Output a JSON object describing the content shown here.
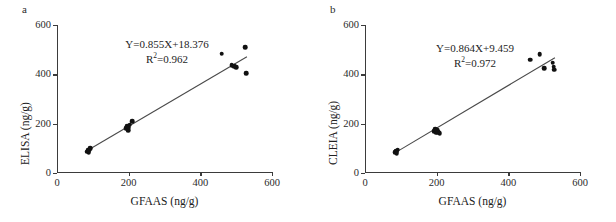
{
  "figure": {
    "background": "#ffffff",
    "marker_color": "#111111",
    "line_color": "#4a4a4a",
    "axis_color": "#3b3b3b"
  },
  "panels": [
    {
      "label": "a",
      "equation": "Y=0.855X+18.376",
      "r2_prefix": "R",
      "r2_exponent": "2",
      "r2_value": "=0.962"
    },
    {
      "label": "b",
      "equation": "Y=0.864X+9.459",
      "r2_prefix": "R",
      "r2_exponent": "2",
      "r2_value": "=0.972"
    }
  ],
  "chart_data": [
    {
      "type": "scatter",
      "title": "a",
      "xlabel": "GFAAS (ng/g)",
      "ylabel": "ELISA (ng/g)",
      "xlim": [
        0,
        600
      ],
      "ylim": [
        0,
        600
      ],
      "xticks": [
        0,
        200,
        400,
        600
      ],
      "yticks": [
        0,
        200,
        400,
        600
      ],
      "grid": false,
      "legend": false,
      "annotations": [
        "Y=0.855X+18.376",
        "R2=0.962"
      ],
      "fit": {
        "slope": 0.855,
        "intercept": 18.376,
        "r2": 0.962,
        "x_start": 80,
        "x_end": 530
      },
      "points": [
        {
          "x": 85,
          "y": 86
        },
        {
          "x": 87,
          "y": 92
        },
        {
          "x": 89,
          "y": 83
        },
        {
          "x": 91,
          "y": 96
        },
        {
          "x": 93,
          "y": 101
        },
        {
          "x": 88,
          "y": 89
        },
        {
          "x": 193,
          "y": 181
        },
        {
          "x": 196,
          "y": 190
        },
        {
          "x": 198,
          "y": 174
        },
        {
          "x": 200,
          "y": 186
        },
        {
          "x": 203,
          "y": 196
        },
        {
          "x": 210,
          "y": 209
        },
        {
          "x": 460,
          "y": 483
        },
        {
          "x": 487,
          "y": 437
        },
        {
          "x": 495,
          "y": 432
        },
        {
          "x": 500,
          "y": 428
        },
        {
          "x": 526,
          "y": 509
        },
        {
          "x": 528,
          "y": 404
        }
      ]
    },
    {
      "type": "scatter",
      "title": "b",
      "xlabel": "GFAAS (ng/g)",
      "ylabel": "CLEIA (ng/g)",
      "xlim": [
        0,
        600
      ],
      "ylim": [
        0,
        600
      ],
      "xticks": [
        0,
        200,
        400,
        600
      ],
      "yticks": [
        0,
        200,
        400,
        600
      ],
      "grid": false,
      "legend": false,
      "annotations": [
        "Y=0.864X+9.459",
        "R2=0.972"
      ],
      "fit": {
        "slope": 0.864,
        "intercept": 9.459,
        "r2": 0.972,
        "x_start": 80,
        "x_end": 530
      },
      "points": [
        {
          "x": 85,
          "y": 84
        },
        {
          "x": 87,
          "y": 90
        },
        {
          "x": 89,
          "y": 86
        },
        {
          "x": 91,
          "y": 95
        },
        {
          "x": 88,
          "y": 80
        },
        {
          "x": 193,
          "y": 170
        },
        {
          "x": 196,
          "y": 177
        },
        {
          "x": 199,
          "y": 163
        },
        {
          "x": 201,
          "y": 173
        },
        {
          "x": 205,
          "y": 166
        },
        {
          "x": 208,
          "y": 161
        },
        {
          "x": 461,
          "y": 459
        },
        {
          "x": 487,
          "y": 481
        },
        {
          "x": 500,
          "y": 425
        },
        {
          "x": 524,
          "y": 447
        },
        {
          "x": 527,
          "y": 431
        },
        {
          "x": 528,
          "y": 418
        }
      ]
    }
  ]
}
